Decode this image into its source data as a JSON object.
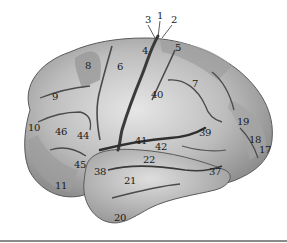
{
  "figure": {
    "type": "brodmann-areas-lateral-view",
    "colors": {
      "cortex_light": "#d9d9d9",
      "cortex_mid": "#a8a8a8",
      "cortex_dark": "#7c7c7c",
      "sulcus": "#3a3a3a",
      "label": "#1a1a1a",
      "rule": "#8a8a8a"
    },
    "labels": [
      {
        "text": "3",
        "x": 148,
        "y": 20
      },
      {
        "text": "1",
        "x": 160,
        "y": 16
      },
      {
        "text": "2",
        "x": 174,
        "y": 20
      },
      {
        "text": "4",
        "x": 145,
        "y": 51
      },
      {
        "text": "5",
        "x": 178,
        "y": 48
      },
      {
        "text": "8",
        "x": 88,
        "y": 66
      },
      {
        "text": "6",
        "x": 120,
        "y": 67
      },
      {
        "text": "9",
        "x": 55,
        "y": 97
      },
      {
        "text": "7",
        "x": 195,
        "y": 84
      },
      {
        "text": "40",
        "x": 157,
        "y": 95
      },
      {
        "text": "10",
        "x": 34,
        "y": 128
      },
      {
        "text": "46",
        "x": 61,
        "y": 132
      },
      {
        "text": "44",
        "x": 83,
        "y": 136
      },
      {
        "text": "41",
        "x": 141,
        "y": 141
      },
      {
        "text": "42",
        "x": 161,
        "y": 147
      },
      {
        "text": "39",
        "x": 205,
        "y": 133
      },
      {
        "text": "19",
        "x": 243,
        "y": 122
      },
      {
        "text": "18",
        "x": 255,
        "y": 140
      },
      {
        "text": "17",
        "x": 265,
        "y": 150
      },
      {
        "text": "22",
        "x": 149,
        "y": 160
      },
      {
        "text": "45",
        "x": 80,
        "y": 165
      },
      {
        "text": "38",
        "x": 100,
        "y": 172
      },
      {
        "text": "37",
        "x": 215,
        "y": 172
      },
      {
        "text": "21",
        "x": 130,
        "y": 181
      },
      {
        "text": "11",
        "x": 61,
        "y": 186
      },
      {
        "text": "20",
        "x": 120,
        "y": 218
      }
    ]
  }
}
